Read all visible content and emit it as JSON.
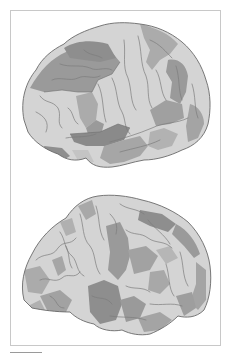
{
  "figure": {
    "panels": [
      {
        "id": "top",
        "view": "lateral brain surface",
        "label": ""
      },
      {
        "id": "bottom",
        "view": "lateral brain surface",
        "label": ""
      }
    ],
    "colors": {
      "background": "#ffffff",
      "frame": "#c8c8c8",
      "outline": "#6a6a6a",
      "sulci": "#7c7c7c",
      "shade_light": "#d4d4d4",
      "shade_mid": "#ababab",
      "shade_dark": "#8e8e8e"
    }
  }
}
